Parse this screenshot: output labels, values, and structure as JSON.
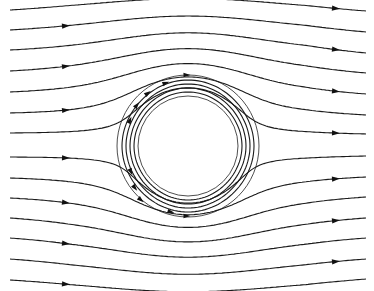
{
  "diagram": {
    "title": "",
    "width": 374,
    "height": 291,
    "colors": {
      "stroke": "#1a1a1a",
      "cylinder": "#3a3a3a",
      "background": "#ffffff"
    },
    "cylinder": {
      "cx": 188,
      "cy": 146,
      "outer_r": 71,
      "inner_r": 50
    },
    "x_start": 10,
    "x_end": 366,
    "left_arrow_x": 66,
    "right_arrow_x": 336,
    "streamlines_left_y": [
      10,
      30,
      50,
      71,
      92,
      113,
      133,
      157,
      178,
      198,
      218,
      238,
      259,
      280
    ],
    "streamlines_right_y": [
      11,
      32,
      53,
      73,
      94,
      115,
      134,
      156,
      177,
      197,
      218,
      238,
      259,
      279
    ],
    "left_arrow_rows": [
      1,
      3,
      5,
      7,
      9,
      11,
      13
    ],
    "right_arrow_rows": [
      0,
      2,
      4,
      6,
      8,
      10,
      12
    ],
    "wrap_arrows": [
      {
        "x": 187,
        "y": 75,
        "dir": 1
      },
      {
        "x": 166,
        "y": 83,
        "dir": 1
      },
      {
        "x": 148,
        "y": 93,
        "dir": 1
      },
      {
        "x": 137,
        "y": 105,
        "dir": 1
      },
      {
        "x": 130,
        "y": 120,
        "dir": 1
      },
      {
        "x": 187,
        "y": 216,
        "dir": 1
      },
      {
        "x": 171,
        "y": 212,
        "dir": 1
      },
      {
        "x": 141,
        "y": 200,
        "dir": 1
      },
      {
        "x": 135,
        "y": 188,
        "dir": 1
      },
      {
        "x": 131,
        "y": 172,
        "dir": 1
      }
    ]
  }
}
